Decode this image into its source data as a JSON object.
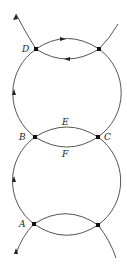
{
  "diagram": {
    "labels": {
      "D": "D",
      "B": "B",
      "C": "C",
      "E": "E",
      "F": "F",
      "A": "A"
    },
    "colors": {
      "stroke": "#333333",
      "background": "#ffffff"
    }
  }
}
